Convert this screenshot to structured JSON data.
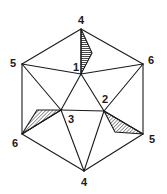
{
  "figure": {
    "vertices": [
      {
        "id": "top",
        "label": "4"
      },
      {
        "id": "upper-left",
        "label": "5"
      },
      {
        "id": "upper-right",
        "label": "6"
      },
      {
        "id": "lower-left",
        "label": "6"
      },
      {
        "id": "lower-right",
        "label": "5"
      },
      {
        "id": "bottom",
        "label": "4"
      },
      {
        "id": "inner-1",
        "label": "1"
      },
      {
        "id": "inner-2",
        "label": "2"
      },
      {
        "id": "inner-3",
        "label": "3"
      }
    ],
    "colors": {
      "line": "#1a1a1a",
      "background": "#ffffff"
    }
  }
}
